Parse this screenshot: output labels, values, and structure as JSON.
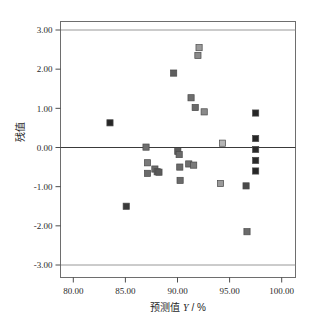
{
  "chart_data": {
    "type": "scatter",
    "title": "",
    "xlabel": "预测值 Y / %",
    "ylabel": "残值",
    "xlim": [
      78.0,
      101.5
    ],
    "ylim": [
      -3.5,
      3.4
    ],
    "xticks": [
      80.0,
      85.0,
      90.0,
      95.0,
      100.0
    ],
    "xticklabels": [
      "80.00",
      "85.00",
      "90.00",
      "95.00",
      "100.00"
    ],
    "yticks": [
      3.0,
      2.0,
      1.0,
      0.0,
      -1.0,
      -2.0,
      -3.0
    ],
    "yticklabels": [
      "3.00",
      "2.00",
      "1.00",
      "0.00",
      "-1.00",
      "-2.00",
      "-3.00"
    ],
    "grid": false,
    "reference_lines": [
      {
        "y": 3.0,
        "style": "solid",
        "color": "#8c8c8c"
      },
      {
        "y": 0.0,
        "style": "solid",
        "color": "#3a3a3a"
      },
      {
        "y": -3.0,
        "style": "solid",
        "color": "#8c8c8c"
      }
    ],
    "legend": null,
    "marker": "square",
    "points": [
      {
        "x": 83.52,
        "y": 0.63,
        "color": "#262626"
      },
      {
        "x": 85.08,
        "y": -1.5,
        "color": "#3a3a3a"
      },
      {
        "x": 86.98,
        "y": 0.01,
        "color": "#6e6e6e"
      },
      {
        "x": 87.12,
        "y": -0.39,
        "color": "#7a7a7a"
      },
      {
        "x": 87.12,
        "y": -0.66,
        "color": "#6a6a6a"
      },
      {
        "x": 87.83,
        "y": -0.55,
        "color": "#6a6a6a"
      },
      {
        "x": 88.05,
        "y": -0.62,
        "color": "#5e5e5e"
      },
      {
        "x": 88.22,
        "y": -0.63,
        "color": "#5a5a5a"
      },
      {
        "x": 89.63,
        "y": 1.9,
        "color": "#5e5e5e"
      },
      {
        "x": 90.03,
        "y": -0.1,
        "color": "#5a5a5a"
      },
      {
        "x": 90.16,
        "y": -0.18,
        "color": "#6a6a6a"
      },
      {
        "x": 90.22,
        "y": -0.5,
        "color": "#6a6a6a"
      },
      {
        "x": 91.08,
        "y": -0.42,
        "color": "#6e6e6e"
      },
      {
        "x": 91.55,
        "y": -0.45,
        "color": "#7a7a7a"
      },
      {
        "x": 90.25,
        "y": -0.84,
        "color": "#6a6a6a"
      },
      {
        "x": 91.3,
        "y": 1.27,
        "color": "#6e6e6e"
      },
      {
        "x": 91.7,
        "y": 1.02,
        "color": "#6a6a6a"
      },
      {
        "x": 92.56,
        "y": 0.91,
        "color": "#8a8a8a"
      },
      {
        "x": 92.07,
        "y": 2.55,
        "color": "#9a9a9a"
      },
      {
        "x": 91.96,
        "y": 2.35,
        "color": "#8a8a8a"
      },
      {
        "x": 94.32,
        "y": 0.11,
        "color": "#b4b4b4"
      },
      {
        "x": 94.13,
        "y": -0.92,
        "color": "#9a9a9a"
      },
      {
        "x": 96.67,
        "y": -2.15,
        "color": "#6a6a6a"
      },
      {
        "x": 96.58,
        "y": -0.98,
        "color": "#4a4a4a"
      },
      {
        "x": 97.5,
        "y": 0.88,
        "color": "#262626"
      },
      {
        "x": 97.5,
        "y": 0.23,
        "color": "#262626"
      },
      {
        "x": 97.5,
        "y": -0.05,
        "color": "#2a2a2a"
      },
      {
        "x": 97.5,
        "y": -0.33,
        "color": "#2a2a2a"
      },
      {
        "x": 97.5,
        "y": -0.6,
        "color": "#262626"
      }
    ]
  },
  "labels": {
    "xaxis_prefix": "预测值",
    "xaxis_var": "Y",
    "xaxis_suffix": "/ %",
    "yaxis": "残值"
  },
  "colors": {
    "frame": "#6e6e6e",
    "axis": "#3a3a3a",
    "reference": "#8c8c8c",
    "text": "#1f1f1f",
    "background": "#ffffff"
  }
}
